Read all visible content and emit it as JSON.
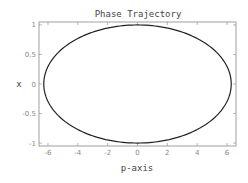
{
  "chart_data": {
    "type": "line",
    "title": "Phase Trajectory",
    "xlabel": "p-axis",
    "ylabel": "x",
    "xlim": [
      -6.6,
      6.6
    ],
    "ylim": [
      -1.05,
      1.05
    ],
    "xticks": [
      -6,
      -4,
      -2,
      0,
      2,
      4,
      6
    ],
    "xtick_labels": [
      "-6",
      "-4",
      "-2",
      "0",
      "2",
      "4",
      "6"
    ],
    "yticks": [
      -1,
      -0.5,
      0,
      0.5,
      1
    ],
    "ytick_labels": [
      "-1",
      "-0.5",
      "0",
      "0.5",
      "1"
    ],
    "grid": false,
    "legend": null,
    "series": [
      {
        "name": "trajectory",
        "shape": "ellipse",
        "p_amplitude": 6.28,
        "x_amplitude": 1.0,
        "center": [
          0,
          0
        ],
        "color": "#222222"
      }
    ]
  }
}
